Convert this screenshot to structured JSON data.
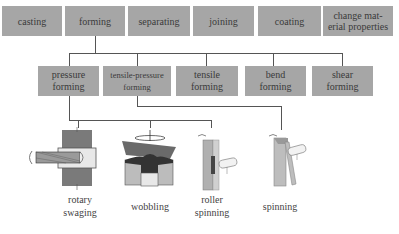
{
  "top_row": [
    {
      "label": "casting"
    },
    {
      "label": "forming"
    },
    {
      "label": "separating"
    },
    {
      "label": "joining"
    },
    {
      "label": "coating"
    },
    {
      "label": "change mat-\nerial properties"
    }
  ],
  "forming_children": [
    {
      "label": "pressure\nforming"
    },
    {
      "label": "tensile-pressure\nforming"
    },
    {
      "label": "tensile\nforming"
    },
    {
      "label": "bend\nforming"
    },
    {
      "label": "shear\nforming"
    }
  ],
  "processes": [
    {
      "label": "rotary\nswaging",
      "parent": "pressure forming"
    },
    {
      "label": "wobbling",
      "parent": "pressure forming"
    },
    {
      "label": "roller\nspinning",
      "parent": "pressure forming"
    },
    {
      "label": "spinning",
      "parent": "tensile-pressure forming"
    }
  ],
  "colors": {
    "box_fill": "#a6a6a6",
    "line": "#555555",
    "text": "#3a3a3a"
  }
}
